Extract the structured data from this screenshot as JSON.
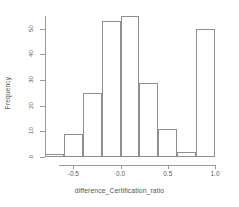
{
  "chart_data": {
    "type": "bar",
    "subtype": "histogram",
    "title": "",
    "xlabel": "difference_Certification_ratio",
    "ylabel": "Frequency",
    "xlim": [
      -0.8,
      1.0
    ],
    "ylim": [
      0,
      55
    ],
    "grid": false,
    "legend": null,
    "bin_width": 0.2,
    "bin_edges": [
      -0.8,
      -0.6,
      -0.4,
      -0.2,
      0.0,
      0.2,
      0.4,
      0.6,
      0.8,
      1.0
    ],
    "categories": [
      "-0.8 to -0.6",
      "-0.6 to -0.4",
      "-0.4 to -0.2",
      "-0.2 to 0.0",
      "0.0 to 0.2",
      "0.2 to 0.4",
      "0.4 to 0.6",
      "0.6 to 0.8",
      "0.8 to 1.0"
    ],
    "values": [
      1,
      9,
      25,
      53,
      55,
      29,
      11,
      2,
      50
    ],
    "x_ticks": [
      -0.5,
      0.0,
      0.5,
      1.0
    ],
    "x_tick_labels": [
      "-0.5",
      "0.0",
      "0.5",
      "1.0"
    ],
    "y_ticks": [
      0,
      10,
      20,
      30,
      40,
      50
    ],
    "y_tick_labels": [
      "0",
      "10",
      "20",
      "30",
      "40",
      "50"
    ],
    "bar_fill": "transparent",
    "bar_border_color": "#8f8f8f",
    "axis_color": "#9a9a9a",
    "text_color": "#5b5b5b",
    "background": "#ffffff"
  }
}
